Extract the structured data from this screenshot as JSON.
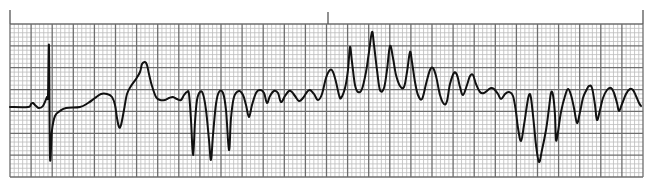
{
  "chart_data": {
    "type": "line",
    "title": "",
    "xlabel": "",
    "ylabel": "",
    "grid": true,
    "legend": null,
    "grid_spec": {
      "left": 10,
      "top": 24,
      "right": 643,
      "bottom": 177,
      "major_x_count": 30,
      "major_y_count": 7,
      "minor_per_major": 5,
      "minor_color": "#bdbdbd",
      "major_color": "#6e6e6e"
    },
    "markers": [
      {
        "x": 10,
        "y1": 10,
        "y2": 24
      },
      {
        "x": 328,
        "y1": 12,
        "y2": 24
      },
      {
        "x": 643,
        "y1": 10,
        "y2": 24
      }
    ],
    "trace_color": "#111111",
    "trace_points": [
      [
        10,
        107
      ],
      [
        28,
        107
      ],
      [
        31,
        104
      ],
      [
        33,
        103
      ],
      [
        36,
        106
      ],
      [
        39,
        108
      ],
      [
        43,
        106
      ],
      [
        47,
        97
      ],
      [
        48,
        95
      ],
      [
        49,
        46
      ],
      [
        50,
        157
      ],
      [
        52,
        130
      ],
      [
        55,
        116
      ],
      [
        60,
        111
      ],
      [
        66,
        108
      ],
      [
        80,
        107
      ],
      [
        88,
        103
      ],
      [
        95,
        98
      ],
      [
        101,
        94
      ],
      [
        107,
        94
      ],
      [
        112,
        97
      ],
      [
        115,
        105
      ],
      [
        117,
        118
      ],
      [
        119,
        127
      ],
      [
        121,
        125
      ],
      [
        124,
        110
      ],
      [
        127,
        94
      ],
      [
        131,
        86
      ],
      [
        136,
        79
      ],
      [
        140,
        72
      ],
      [
        142,
        64
      ],
      [
        145,
        62
      ],
      [
        147,
        65
      ],
      [
        149,
        74
      ],
      [
        152,
        86
      ],
      [
        156,
        97
      ],
      [
        160,
        100
      ],
      [
        165,
        100
      ],
      [
        169,
        98
      ],
      [
        173,
        97
      ],
      [
        177,
        99
      ],
      [
        181,
        100
      ],
      [
        184,
        95
      ],
      [
        187,
        92
      ],
      [
        189,
        94
      ],
      [
        191,
        120
      ],
      [
        193,
        155
      ],
      [
        195,
        122
      ],
      [
        197,
        100
      ],
      [
        200,
        92
      ],
      [
        203,
        94
      ],
      [
        206,
        110
      ],
      [
        209,
        140
      ],
      [
        211,
        160
      ],
      [
        213,
        135
      ],
      [
        216,
        104
      ],
      [
        219,
        92
      ],
      [
        223,
        93
      ],
      [
        226,
        110
      ],
      [
        229,
        150
      ],
      [
        231,
        118
      ],
      [
        234,
        97
      ],
      [
        239,
        91
      ],
      [
        243,
        95
      ],
      [
        246,
        105
      ],
      [
        249,
        117
      ],
      [
        252,
        105
      ],
      [
        256,
        93
      ],
      [
        260,
        90
      ],
      [
        264,
        93
      ],
      [
        267,
        103
      ],
      [
        270,
        96
      ],
      [
        274,
        91
      ],
      [
        278,
        93
      ],
      [
        281,
        102
      ],
      [
        285,
        96
      ],
      [
        289,
        91
      ],
      [
        292,
        92
      ],
      [
        295,
        96
      ],
      [
        299,
        101
      ],
      [
        303,
        98
      ],
      [
        307,
        92
      ],
      [
        310,
        90
      ],
      [
        314,
        94
      ],
      [
        318,
        100
      ],
      [
        322,
        94
      ],
      [
        326,
        78
      ],
      [
        330,
        70
      ],
      [
        333,
        72
      ],
      [
        336,
        82
      ],
      [
        339,
        95
      ],
      [
        341,
        98
      ],
      [
        345,
        88
      ],
      [
        348,
        70
      ],
      [
        350,
        47
      ],
      [
        352,
        62
      ],
      [
        355,
        85
      ],
      [
        358,
        92
      ],
      [
        362,
        89
      ],
      [
        366,
        72
      ],
      [
        369,
        52
      ],
      [
        372,
        32
      ],
      [
        374,
        45
      ],
      [
        377,
        70
      ],
      [
        380,
        90
      ],
      [
        384,
        88
      ],
      [
        387,
        70
      ],
      [
        390,
        46
      ],
      [
        393,
        58
      ],
      [
        396,
        75
      ],
      [
        400,
        86
      ],
      [
        404,
        87
      ],
      [
        407,
        72
      ],
      [
        410,
        52
      ],
      [
        412,
        62
      ],
      [
        415,
        82
      ],
      [
        418,
        95
      ],
      [
        422,
        99
      ],
      [
        426,
        84
      ],
      [
        430,
        70
      ],
      [
        433,
        68
      ],
      [
        436,
        76
      ],
      [
        440,
        95
      ],
      [
        444,
        104
      ],
      [
        447,
        101
      ],
      [
        450,
        84
      ],
      [
        454,
        73
      ],
      [
        457,
        75
      ],
      [
        460,
        87
      ],
      [
        463,
        95
      ],
      [
        467,
        85
      ],
      [
        470,
        76
      ],
      [
        473,
        75
      ],
      [
        476,
        84
      ],
      [
        480,
        92
      ],
      [
        484,
        93
      ],
      [
        488,
        90
      ],
      [
        491,
        88
      ],
      [
        494,
        89
      ],
      [
        498,
        94
      ],
      [
        501,
        99
      ],
      [
        505,
        94
      ],
      [
        509,
        92
      ],
      [
        513,
        96
      ],
      [
        516,
        112
      ],
      [
        518,
        128
      ],
      [
        521,
        141
      ],
      [
        524,
        125
      ],
      [
        527,
        105
      ],
      [
        529,
        95
      ],
      [
        531,
        98
      ],
      [
        534,
        125
      ],
      [
        536,
        145
      ],
      [
        539,
        162
      ],
      [
        542,
        150
      ],
      [
        546,
        130
      ],
      [
        549,
        108
      ],
      [
        551,
        93
      ],
      [
        553,
        95
      ],
      [
        555,
        115
      ],
      [
        556,
        140
      ],
      [
        558,
        132
      ],
      [
        561,
        112
      ],
      [
        565,
        96
      ],
      [
        568,
        89
      ],
      [
        571,
        95
      ],
      [
        574,
        108
      ],
      [
        577,
        123
      ],
      [
        580,
        112
      ],
      [
        583,
        98
      ],
      [
        586,
        91
      ],
      [
        589,
        86
      ],
      [
        592,
        88
      ],
      [
        595,
        105
      ],
      [
        597,
        120
      ],
      [
        600,
        110
      ],
      [
        603,
        98
      ],
      [
        607,
        90
      ],
      [
        611,
        88
      ],
      [
        614,
        93
      ],
      [
        617,
        103
      ],
      [
        619,
        111
      ],
      [
        622,
        104
      ],
      [
        626,
        94
      ],
      [
        630,
        89
      ],
      [
        633,
        90
      ],
      [
        636,
        96
      ],
      [
        639,
        103
      ],
      [
        641,
        106
      ]
    ]
  }
}
